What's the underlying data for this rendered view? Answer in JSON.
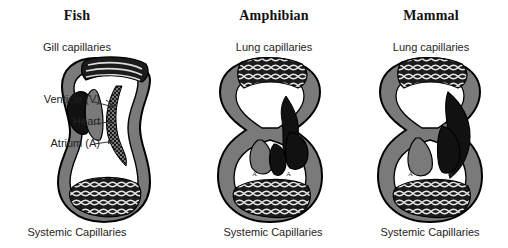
{
  "figure": {
    "caption_style": "comparative vertebrate circulatory systems",
    "background": "#ffffff",
    "ink": "#111111"
  },
  "colors": {
    "deoxygenated_vessel": "#111111",
    "oxygenated_vessel": "#7a7a7a",
    "capillary_bed_fill": "#1b1b1b",
    "vessel_outline": "#000000",
    "lumen": "#ffffff",
    "text": "#242424"
  },
  "panels": [
    {
      "id": "fish",
      "title": "Fish",
      "top_capillaries": "Gill capillaries",
      "bottom_capillaries": "Systemic Capillaries",
      "chamber_count": 2,
      "chamber_marks": [],
      "circulation": "single"
    },
    {
      "id": "amphibian",
      "title": "Amphibian",
      "top_capillaries": "Lung capillaries",
      "bottom_capillaries": "Systemic Capillaries",
      "chamber_count": 3,
      "chamber_marks": [
        "A",
        "A",
        "V"
      ],
      "circulation": "double-incomplete"
    },
    {
      "id": "mammal",
      "title": "Mammal",
      "top_capillaries": "Lung capillaries",
      "bottom_capillaries": "Systemic Capillaries",
      "chamber_count": 4,
      "chamber_marks": [
        "A",
        "A",
        "V",
        "V"
      ],
      "circulation": "double-complete"
    }
  ],
  "heart_labels": [
    {
      "id": "ventricle",
      "text": "Venticle (V)"
    },
    {
      "id": "heart",
      "text": "Heart"
    },
    {
      "id": "atrium",
      "text": "Atrium (A)"
    }
  ],
  "chamber_mark_glyphs": {
    "atrium": "A",
    "ventricle": "V"
  }
}
